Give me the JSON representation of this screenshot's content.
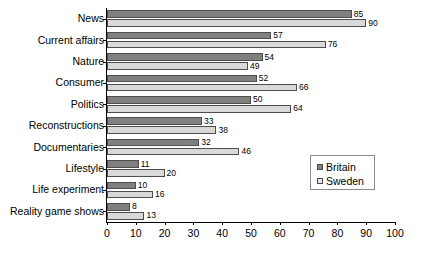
{
  "chart_data": {
    "type": "bar",
    "orientation": "horizontal",
    "title": "",
    "xlabel": "",
    "ylabel": "",
    "xlim": [
      0,
      100
    ],
    "xticks": [
      0,
      10,
      20,
      30,
      40,
      50,
      60,
      70,
      80,
      90,
      100
    ],
    "grid": false,
    "legend_position": "right",
    "categories": [
      "News",
      "Current affairs",
      "Nature",
      "Consumer",
      "Politics",
      "Reconstructions",
      "Documentaries",
      "Lifestyle",
      "Life experiment",
      "Reality game shows"
    ],
    "series": [
      {
        "name": "Britain",
        "color": "#808080",
        "values": [
          85,
          57,
          54,
          52,
          50,
          33,
          32,
          11,
          10,
          8
        ]
      },
      {
        "name": "Sweden",
        "color": "#d9d9d9",
        "values": [
          90,
          76,
          49,
          66,
          64,
          38,
          46,
          20,
          16,
          13
        ]
      }
    ]
  },
  "legend": {
    "items": [
      {
        "label": "Britain"
      },
      {
        "label": "Sweden"
      }
    ]
  },
  "caption": ""
}
